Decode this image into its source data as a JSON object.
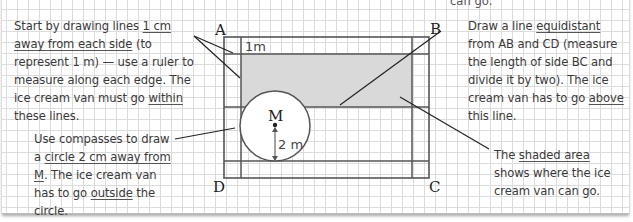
{
  "figure": {
    "title_fragment": "can go.",
    "vertices": {
      "A": "A",
      "B": "B",
      "C": "C",
      "D": "D"
    },
    "center_label": "M",
    "border_label": "1m",
    "radius_label": "2 m",
    "colors": {
      "shaded": "#d9d9d9",
      "lines": "#555555",
      "leader": "#222222",
      "grid": "#dcdcdc"
    }
  },
  "notes": {
    "top_left": {
      "pre": "Start by drawing lines ",
      "u1": "1 cm away from each side",
      "mid": " (to represent 1 m) — use a ruler to measure along each edge.  The ice cream van must go ",
      "u2": "within",
      "post": " these lines."
    },
    "bottom_left": {
      "pre": "Use compasses to draw a ",
      "u1": "circle 2 cm away from M",
      "mid": ". The ice cream van has to go ",
      "u2": "outside",
      "post": " the circle."
    },
    "top_right": {
      "pre": "Draw a line ",
      "u1": "equidistant",
      "mid": " from AB and CD (measure the length of side BC and divide it by two).  The ice cream van has to go ",
      "u2": "above",
      "post": " this line."
    },
    "bottom_right": {
      "pre": "The ",
      "u1": "shaded area",
      "post": " shows where the ice cream van can go."
    }
  }
}
